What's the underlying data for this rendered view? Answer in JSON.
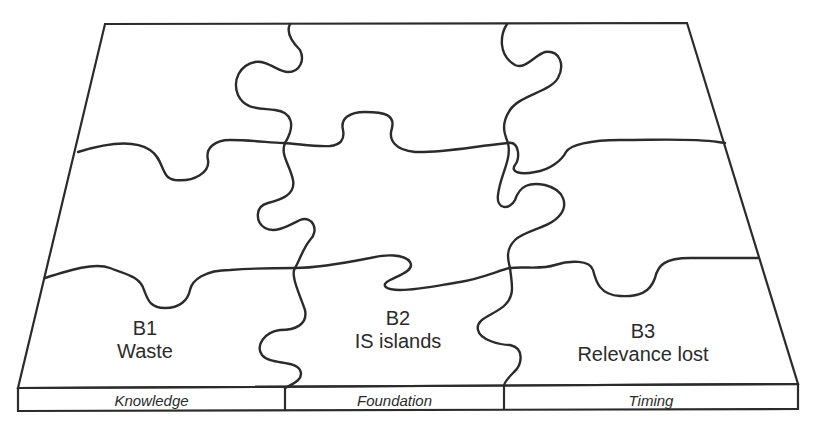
{
  "diagram": {
    "type": "jigsaw-puzzle",
    "colors": {
      "line": "#2b2b2b",
      "background": "#ffffff"
    },
    "pieces": [
      {
        "code": "B1",
        "name": "Waste"
      },
      {
        "code": "B2",
        "name": "IS islands"
      },
      {
        "code": "B3",
        "name": "Relevance lost"
      }
    ],
    "base_strip": [
      {
        "label": "Knowledge"
      },
      {
        "label": "Foundation"
      },
      {
        "label": "Timing"
      }
    ]
  }
}
